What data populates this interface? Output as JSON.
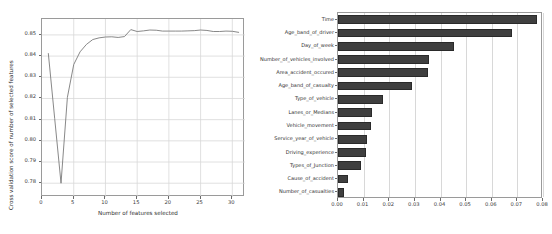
{
  "chart_data": [
    {
      "type": "line",
      "id": "rfecv-curve",
      "title": "",
      "xlabel": "Number of features selected",
      "ylabel": "Cross validation score of number of selected features",
      "xlim": [
        0,
        32
      ],
      "ylim": [
        0.7735,
        0.8575
      ],
      "grid": true,
      "legend": "none",
      "xticks": [
        0,
        5,
        10,
        15,
        20,
        25,
        30
      ],
      "xtick_labels": [
        "0",
        "5",
        "10",
        "15",
        "20",
        "25",
        "30"
      ],
      "yticks": [
        0.78,
        0.79,
        0.8,
        0.81,
        0.82,
        0.83,
        0.84,
        0.85
      ],
      "ytick_labels": [
        "0.78",
        "0.79",
        "0.80",
        "0.81",
        "0.82",
        "0.83",
        "0.84",
        "0.85"
      ],
      "x": [
        1,
        2,
        3,
        4,
        5,
        6,
        7,
        8,
        9,
        10,
        11,
        12,
        13,
        14,
        15,
        16,
        17,
        18,
        19,
        20,
        21,
        22,
        23,
        24,
        25,
        26,
        27,
        28,
        29,
        30,
        31
      ],
      "values": [
        0.8412,
        0.8105,
        0.78,
        0.8205,
        0.836,
        0.842,
        0.8455,
        0.8478,
        0.8486,
        0.849,
        0.8491,
        0.8488,
        0.8492,
        0.8525,
        0.8516,
        0.8519,
        0.8523,
        0.8522,
        0.8518,
        0.8518,
        0.8518,
        0.8518,
        0.8519,
        0.852,
        0.8523,
        0.8521,
        0.8516,
        0.8516,
        0.8518,
        0.8517,
        0.8512
      ],
      "line_color": "#7b7b7b"
    },
    {
      "type": "bar",
      "id": "feature-importance",
      "orientation": "horizontal",
      "title": "",
      "xlabel": "",
      "ylabel": "",
      "xlim": [
        0,
        0.08
      ],
      "grid": true,
      "legend": "none",
      "xticks": [
        0.0,
        0.01,
        0.02,
        0.03,
        0.04,
        0.05,
        0.06,
        0.07,
        0.08
      ],
      "xtick_labels": [
        "0.00",
        "0.01",
        "0.02",
        "0.03",
        "0.04",
        "0.05",
        "0.06",
        "0.07",
        "0.08"
      ],
      "categories": [
        "Time",
        "Age_band_of_driver",
        "Day_of_week",
        "Number_of_vehicles_involved",
        "Area_accident_occured",
        "Age_band_of_casualty",
        "Type_of_vehicle",
        "Lanes_or_Medians",
        "Vehicle_movement",
        "Service_year_of_vehicle",
        "Driving_experience",
        "Types_of_Junction",
        "Cause_of_accident",
        "Number_of_casualties"
      ],
      "values": [
        0.0778,
        0.0679,
        0.0452,
        0.0356,
        0.035,
        0.0288,
        0.0177,
        0.0131,
        0.013,
        0.0114,
        0.0109,
        0.0088,
        0.0038,
        0.0022
      ],
      "bar_color": "#3f3f3f"
    }
  ]
}
